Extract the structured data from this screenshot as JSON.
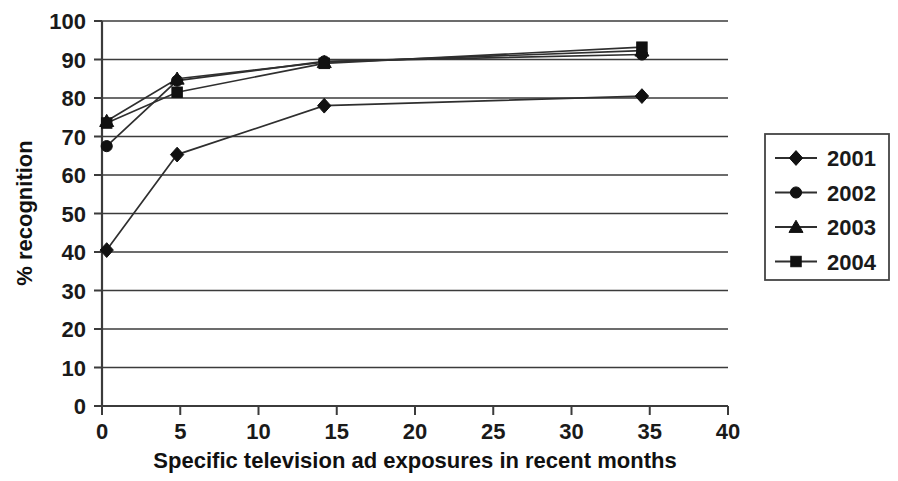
{
  "chart_data": {
    "type": "line",
    "title": "",
    "xlabel": "Specific television ad exposures in recent months",
    "ylabel": "% recognition",
    "xlim": [
      0,
      40
    ],
    "ylim": [
      0,
      100
    ],
    "xticks": [
      "0",
      "5",
      "10",
      "15",
      "20",
      "25",
      "30",
      "35",
      "40"
    ],
    "yticks": [
      "0",
      "10",
      "20",
      "30",
      "40",
      "50",
      "60",
      "70",
      "80",
      "90",
      "100"
    ],
    "grid": "horizontal",
    "legend_position": "right",
    "x": [
      0.3,
      4.8,
      14.2,
      34.5
    ],
    "series": [
      {
        "name": "2001",
        "marker": "diamond",
        "values": [
          40.5,
          65.3,
          78.0,
          80.5
        ]
      },
      {
        "name": "2002",
        "marker": "circle",
        "values": [
          67.5,
          84.5,
          89.5,
          91.3
        ]
      },
      {
        "name": "2003",
        "marker": "triangle",
        "values": [
          74.0,
          85.0,
          89.3,
          92.3
        ]
      },
      {
        "name": "2004",
        "marker": "square",
        "values": [
          73.5,
          81.5,
          89.0,
          93.2
        ]
      }
    ]
  },
  "legend": {
    "entries": [
      {
        "label": "2001",
        "marker": "diamond"
      },
      {
        "label": "2002",
        "marker": "circle"
      },
      {
        "label": "2003",
        "marker": "triangle"
      },
      {
        "label": "2004",
        "marker": "square"
      }
    ]
  },
  "colors": {
    "axis": "#3b3b3b",
    "line": "#2f2f2f",
    "marker": "#111111",
    "text": "#1a1a1a",
    "background": "#ffffff"
  }
}
